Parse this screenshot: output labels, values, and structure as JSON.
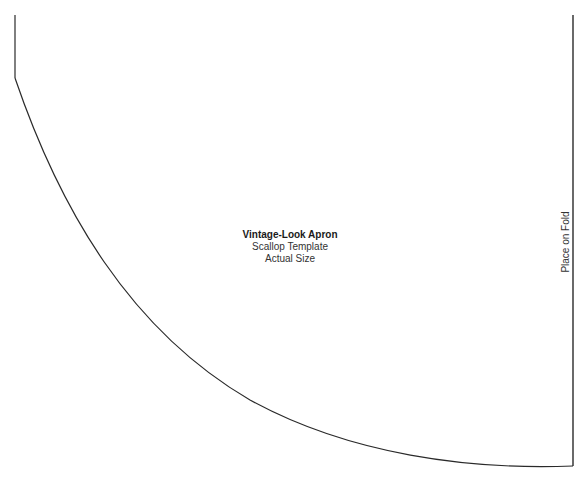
{
  "pattern": {
    "title": "Vintage-Look Apron",
    "subtitle": "Scallop Template",
    "scale_note": "Actual Size",
    "fold_label": "Place on Fold"
  },
  "colors": {
    "background": "#ffffff",
    "outline": "#2a2a2a",
    "text": "#1a1a1a"
  },
  "outline": {
    "left_edge": {
      "x": 15,
      "y_top": 15,
      "y_bottom": 78
    },
    "right_edge": {
      "x": 573,
      "y_top": 15,
      "y_bottom": 466
    },
    "curve_points": [
      [
        15,
        78
      ],
      [
        60,
        200
      ],
      [
        120,
        310
      ],
      [
        200,
        373
      ],
      [
        400,
        452
      ],
      [
        573,
        466
      ]
    ]
  }
}
